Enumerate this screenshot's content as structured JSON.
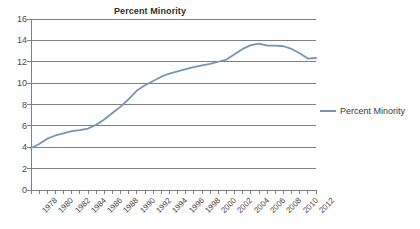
{
  "chart_data": {
    "type": "line",
    "title": "Percent Minority",
    "xlabel": "",
    "ylabel": "",
    "ylim": [
      0,
      16
    ],
    "ytick_step": 2,
    "yticks": [
      0,
      2,
      4,
      6,
      8,
      10,
      12,
      14,
      16
    ],
    "xlim": [
      1978,
      2013
    ],
    "xticks": [
      1978,
      1979,
      1980,
      1981,
      1982,
      1983,
      1984,
      1985,
      1986,
      1987,
      1988,
      1989,
      1990,
      1991,
      1992,
      1993,
      1994,
      1995,
      1996,
      1997,
      1998,
      1999,
      2000,
      2001,
      2002,
      2003,
      2004,
      2005,
      2006,
      2007,
      2008,
      2009,
      2010,
      2011,
      2012,
      2013
    ],
    "xtick_labels": [
      "1978",
      "1980",
      "1982",
      "1984",
      "1986",
      "1988",
      "1990",
      "1992",
      "1994",
      "1996",
      "1998",
      "2000",
      "2002",
      "2004",
      "2006",
      "2008",
      "2010",
      "2012"
    ],
    "xtick_label_years": [
      1978,
      1980,
      1982,
      1984,
      1986,
      1988,
      1990,
      1992,
      1994,
      1996,
      1998,
      2000,
      2002,
      2004,
      2006,
      2008,
      2010,
      2012
    ],
    "xtick_label_rotation": -45,
    "grid": "horizontal",
    "legend_position": "right",
    "line_color": "#7495b8",
    "grid_color": "#808080",
    "series": [
      {
        "name": "Percent Minority",
        "x": [
          1978,
          1979,
          1980,
          1981,
          1982,
          1983,
          1984,
          1985,
          1986,
          1987,
          1988,
          1989,
          1990,
          1991,
          1992,
          1993,
          1994,
          1995,
          1996,
          1997,
          1998,
          1999,
          2000,
          2001,
          2002,
          2003,
          2004,
          2005,
          2006,
          2007,
          2008,
          2009,
          2010,
          2011,
          2012,
          2013
        ],
        "values": [
          3.9,
          4.3,
          4.8,
          5.1,
          5.3,
          5.5,
          5.6,
          5.75,
          6.1,
          6.6,
          7.2,
          7.8,
          8.5,
          9.3,
          9.8,
          10.2,
          10.6,
          10.9,
          11.1,
          11.3,
          11.5,
          11.65,
          11.8,
          12.0,
          12.2,
          12.7,
          13.2,
          13.55,
          13.7,
          13.5,
          13.5,
          13.45,
          13.2,
          12.8,
          12.3,
          12.35
        ]
      }
    ]
  },
  "legend": {
    "entries": [
      {
        "label": "Percent Minority",
        "color": "#7495b8"
      }
    ]
  }
}
